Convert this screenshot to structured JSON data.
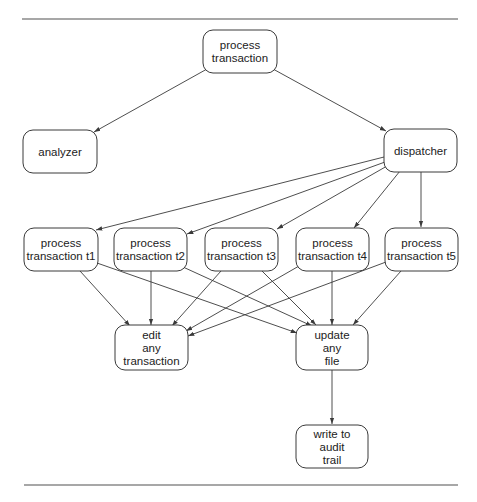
{
  "diagram": {
    "rules": [
      {
        "name": "top-rule",
        "x1": 22,
        "y1": 19,
        "x2": 458,
        "y2": 19
      },
      {
        "name": "bottom-rule",
        "x1": 24,
        "y1": 485,
        "x2": 458,
        "y2": 485
      }
    ],
    "nodes": [
      {
        "id": "process_transaction",
        "lines": [
          "process",
          "transaction"
        ],
        "x": 203,
        "y": 30,
        "w": 74,
        "h": 43
      },
      {
        "id": "analyzer",
        "lines": [
          "analyzer"
        ],
        "x": 23,
        "y": 130,
        "w": 74,
        "h": 43
      },
      {
        "id": "dispatcher",
        "lines": [
          "dispatcher"
        ],
        "x": 384,
        "y": 129,
        "w": 73,
        "h": 43
      },
      {
        "id": "t1",
        "lines": [
          "process",
          "transaction t1"
        ],
        "x": 24,
        "y": 228,
        "w": 74,
        "h": 43
      },
      {
        "id": "t2",
        "lines": [
          "process",
          "transaction t2"
        ],
        "x": 114,
        "y": 228,
        "w": 73,
        "h": 43
      },
      {
        "id": "t3",
        "lines": [
          "process",
          "transaction t3"
        ],
        "x": 205,
        "y": 228,
        "w": 73,
        "h": 43
      },
      {
        "id": "t4",
        "lines": [
          "process",
          "transaction t4"
        ],
        "x": 296,
        "y": 228,
        "w": 73,
        "h": 43
      },
      {
        "id": "t5",
        "lines": [
          "process",
          "transaction t5"
        ],
        "x": 385,
        "y": 228,
        "w": 73,
        "h": 43
      },
      {
        "id": "edit",
        "lines": [
          "edit",
          "any",
          "transaction"
        ],
        "x": 115,
        "y": 325,
        "w": 73,
        "h": 45
      },
      {
        "id": "update",
        "lines": [
          "update",
          "any",
          "file"
        ],
        "x": 296,
        "y": 325,
        "w": 72,
        "h": 45
      },
      {
        "id": "audit",
        "lines": [
          "write to",
          "audit",
          "trail"
        ],
        "x": 296,
        "y": 425,
        "w": 72,
        "h": 43
      }
    ],
    "edges": [
      {
        "from": "process_transaction",
        "to": "analyzer",
        "x1": 207,
        "y1": 69,
        "x2": 94,
        "y2": 132
      },
      {
        "from": "process_transaction",
        "to": "dispatcher",
        "x1": 273,
        "y1": 69,
        "x2": 386,
        "y2": 131
      },
      {
        "from": "dispatcher",
        "to": "t1",
        "x1": 384,
        "y1": 157,
        "x2": 96,
        "y2": 230
      },
      {
        "from": "dispatcher",
        "to": "t2",
        "x1": 385,
        "y1": 162,
        "x2": 187,
        "y2": 234
      },
      {
        "from": "dispatcher",
        "to": "t3",
        "x1": 387,
        "y1": 166,
        "x2": 277,
        "y2": 229
      },
      {
        "from": "dispatcher",
        "to": "t4",
        "x1": 400,
        "y1": 171,
        "x2": 354,
        "y2": 228
      },
      {
        "from": "dispatcher",
        "to": "t5",
        "x1": 421,
        "y1": 172,
        "x2": 421,
        "y2": 227
      },
      {
        "from": "t1",
        "to": "edit",
        "x1": 80,
        "y1": 271,
        "x2": 130,
        "y2": 326
      },
      {
        "from": "t1",
        "to": "update",
        "x1": 97,
        "y1": 263,
        "x2": 297,
        "y2": 333
      },
      {
        "from": "t2",
        "to": "edit",
        "x1": 151,
        "y1": 271,
        "x2": 151,
        "y2": 325
      },
      {
        "from": "t2",
        "to": "update",
        "x1": 183,
        "y1": 267,
        "x2": 312,
        "y2": 326
      },
      {
        "from": "t3",
        "to": "edit",
        "x1": 221,
        "y1": 271,
        "x2": 172,
        "y2": 326
      },
      {
        "from": "t3",
        "to": "update",
        "x1": 262,
        "y1": 271,
        "x2": 316,
        "y2": 325
      },
      {
        "from": "t4",
        "to": "edit",
        "x1": 299,
        "y1": 266,
        "x2": 186,
        "y2": 331
      },
      {
        "from": "t4",
        "to": "update",
        "x1": 332,
        "y1": 271,
        "x2": 332,
        "y2": 325
      },
      {
        "from": "t5",
        "to": "edit",
        "x1": 386,
        "y1": 262,
        "x2": 188,
        "y2": 336
      },
      {
        "from": "t5",
        "to": "update",
        "x1": 401,
        "y1": 271,
        "x2": 353,
        "y2": 325
      },
      {
        "from": "update",
        "to": "audit",
        "x1": 332,
        "y1": 370,
        "x2": 332,
        "y2": 424
      }
    ],
    "colors": {
      "stroke": "#3a3a3a",
      "rule": "#8a8a8a",
      "text": "#222222",
      "background": "#ffffff"
    }
  }
}
